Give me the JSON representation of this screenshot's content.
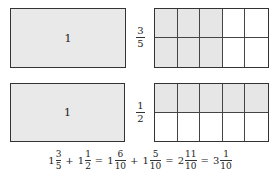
{
  "diagram": {
    "rows": [
      {
        "whole_box_label": "1",
        "fraction_label": {
          "numerator": "3",
          "denominator": "5"
        },
        "grid": {
          "columns": 5,
          "rows": 2,
          "shaded_columns": 3,
          "shaded_rows": 2
        }
      },
      {
        "whole_box_label": "1",
        "fraction_label": {
          "numerator": "1",
          "denominator": "2"
        },
        "grid": {
          "columns": 5,
          "rows": 2,
          "shaded_columns": 5,
          "shaded_rows": 1
        }
      }
    ],
    "equation": {
      "terms": [
        {
          "whole": "1",
          "numerator": "3",
          "denominator": "5"
        },
        {
          "op": "+"
        },
        {
          "whole": "1",
          "numerator": "1",
          "denominator": "2"
        },
        {
          "op": "="
        },
        {
          "whole": "1",
          "numerator": "6",
          "denominator": "10"
        },
        {
          "op": "+"
        },
        {
          "whole": "1",
          "numerator": "5",
          "denominator": "10"
        },
        {
          "op": "="
        },
        {
          "whole": "2",
          "numerator": "11",
          "denominator": "10"
        },
        {
          "op": "="
        },
        {
          "whole": "3",
          "numerator": "1",
          "denominator": "10"
        }
      ]
    },
    "colors": {
      "shaded": "#e6e6e6",
      "border": "#333333",
      "background": "#ffffff"
    }
  }
}
